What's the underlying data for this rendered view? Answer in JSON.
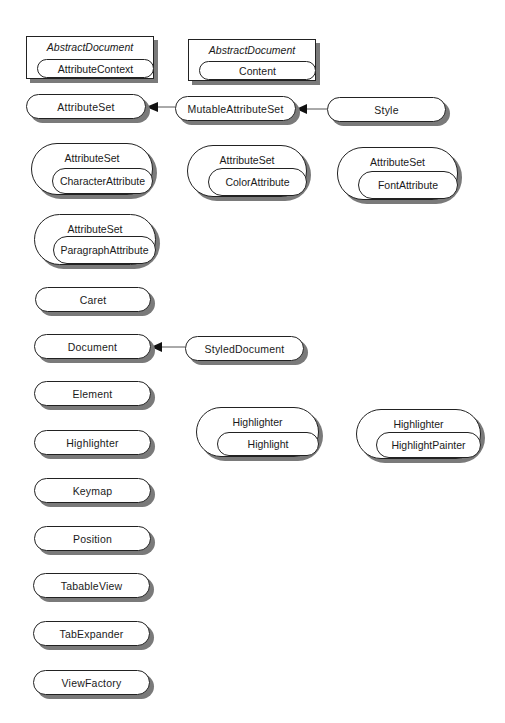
{
  "diagram": {
    "nested_boxes": [
      {
        "outer": "AbstractDocument",
        "inner": "AttributeContext"
      },
      {
        "outer": "AbstractDocument",
        "inner": "Content"
      }
    ],
    "attribute_chain": {
      "base": "AttributeSet",
      "mid": "MutableAttributeSet",
      "leaf": "Style"
    },
    "attribute_groups": [
      {
        "outer": "AttributeSet",
        "inner": "CharacterAttribute"
      },
      {
        "outer": "AttributeSet",
        "inner": "ColorAttribute"
      },
      {
        "outer": "AttributeSet",
        "inner": "FontAttribute"
      },
      {
        "outer": "AttributeSet",
        "inner": "ParagraphAttribute"
      }
    ],
    "interfaces": {
      "caret": "Caret",
      "document": "Document",
      "styled_document": "StyledDocument",
      "element": "Element",
      "highlighter": "Highlighter",
      "keymap": "Keymap",
      "position": "Position",
      "tabable_view": "TabableView",
      "tab_expander": "TabExpander",
      "view_factory": "ViewFactory"
    },
    "highlighter_groups": [
      {
        "outer": "Highlighter",
        "inner": "Highlight"
      },
      {
        "outer": "Highlighter",
        "inner": "HighlightPainter"
      }
    ],
    "relations": [
      {
        "from": "MutableAttributeSet",
        "to": "AttributeSet",
        "type": "extends"
      },
      {
        "from": "Style",
        "to": "MutableAttributeSet",
        "type": "extends"
      },
      {
        "from": "StyledDocument",
        "to": "Document",
        "type": "extends"
      }
    ],
    "colors": {
      "line": "#222222",
      "shadow": "#7a7a7a",
      "background": "#ffffff"
    }
  }
}
